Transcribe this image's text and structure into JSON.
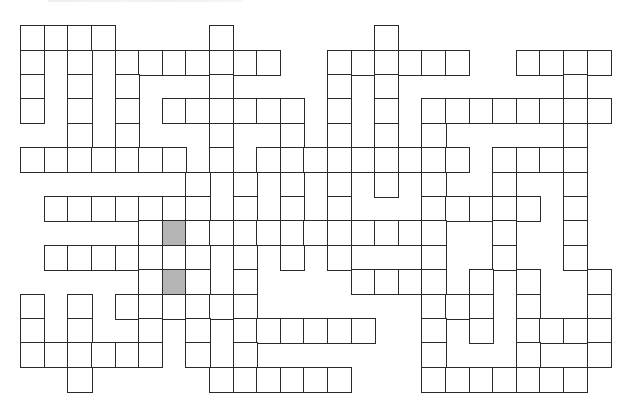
{
  "puzzle": {
    "type": "crossword",
    "cols": 25,
    "rows": 15,
    "layout": {
      "origin_x": 21,
      "origin_y": 26,
      "cell_w": 23.6,
      "cell_h": 24.4
    },
    "colors": {
      "border": "#2a2a2a",
      "cell": "#ffffff",
      "shaded": "#b5b5b5"
    },
    "heading_visible": false,
    "row_cells": [
      [
        0,
        1,
        2,
        3,
        8,
        15
      ],
      [
        0,
        2,
        4,
        5,
        6,
        7,
        8,
        9,
        10,
        13,
        14,
        15,
        16,
        17,
        18,
        21,
        22,
        23,
        24
      ],
      [
        0,
        2,
        4,
        8,
        13,
        15,
        23
      ],
      [
        0,
        2,
        4,
        6,
        7,
        8,
        9,
        10,
        11,
        13,
        15,
        17,
        18,
        19,
        20,
        21,
        22,
        23,
        24
      ],
      [
        2,
        4,
        8,
        11,
        13,
        15,
        17,
        23
      ],
      [
        0,
        1,
        2,
        3,
        4,
        5,
        6,
        8,
        10,
        11,
        12,
        13,
        14,
        15,
        16,
        17,
        18,
        20,
        21,
        22,
        23
      ],
      [
        7,
        9,
        11,
        13,
        15,
        17,
        20,
        23
      ],
      [
        1,
        2,
        3,
        4,
        5,
        6,
        7,
        9,
        11,
        13,
        17,
        18,
        19,
        20,
        21,
        23
      ],
      [
        5,
        6,
        7,
        8,
        9,
        10,
        11,
        12,
        13,
        14,
        15,
        16,
        17,
        20,
        23
      ],
      [
        1,
        2,
        3,
        4,
        5,
        6,
        7,
        9,
        11,
        13,
        17,
        20,
        23
      ],
      [
        5,
        6,
        7,
        9,
        14,
        15,
        16,
        17,
        19,
        21,
        24
      ],
      [
        0,
        2,
        4,
        5,
        6,
        7,
        8,
        9,
        17,
        18,
        19,
        21,
        24
      ],
      [
        0,
        2,
        5,
        7,
        9,
        10,
        11,
        12,
        13,
        14,
        17,
        19,
        21,
        22,
        23,
        24
      ],
      [
        0,
        1,
        2,
        3,
        4,
        5,
        7,
        9,
        17,
        21,
        24
      ],
      [
        2,
        8,
        9,
        10,
        11,
        12,
        13,
        17,
        18,
        19,
        20,
        21,
        22,
        23
      ]
    ],
    "shaded_cells": [
      [
        8,
        6
      ],
      [
        10,
        6
      ]
    ]
  }
}
